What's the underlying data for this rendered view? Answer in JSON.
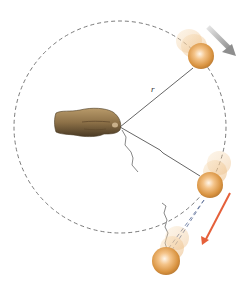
{
  "diagram": {
    "labels": {
      "radius": "r"
    },
    "colors": {
      "background": "#ffffff",
      "circle_path": "#6b6b6b",
      "string": "#555555",
      "ball_light": "#fbe3c2",
      "ball_mid": "#e3a35a",
      "ball_dark": "#b97a33",
      "velocity_arrow_top": "#9a9a9a",
      "velocity_arrow_tangent": "#e5603a",
      "hand": "#8b7350"
    },
    "elements": {
      "hand": "hand holding string at center",
      "ball_top": "ball at upper-right of circle moving clockwise",
      "ball_right": "ball at lower-right at moment string breaks",
      "ball_released": "ball flying off tangentially after release",
      "arrow_top": "gray arrow showing circular motion direction",
      "arrow_tangent": "orange arrow showing tangential velocity after release"
    }
  }
}
